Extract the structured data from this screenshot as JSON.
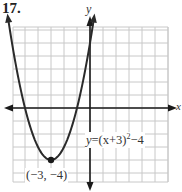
{
  "problem": {
    "number": "17."
  },
  "axes": {
    "x_label": "x",
    "y_label": "y"
  },
  "equation": {
    "lhs": "y",
    "rhs_prefix": "=(x+3)",
    "exponent": "2",
    "rhs_suffix": "−4",
    "full": "y=(x+3)^2−4"
  },
  "vertex": {
    "label": "(−3,  −4)",
    "x": -3,
    "y": -4
  },
  "colors": {
    "grid": "#c8c8c8",
    "axis": "#1a1a1a",
    "curve": "#2a2a2a"
  },
  "chart_data": {
    "type": "line",
    "title": "17.",
    "function": "y=(x+3)^2-4",
    "xlabel": "x",
    "ylabel": "y",
    "xlim": [
      -6,
      6
    ],
    "ylim": [
      -6,
      6
    ],
    "grid": true,
    "grid_step": 1,
    "legend": null,
    "series": [
      {
        "name": "y=(x+3)^2-4",
        "x": [
          -6.3,
          -6,
          -5,
          -4,
          -3,
          -2,
          -1,
          0,
          0.3
        ],
        "y": [
          6.9,
          5,
          0,
          -3,
          -4,
          -3,
          0,
          5,
          6.9
        ]
      }
    ],
    "annotations": [
      {
        "text": "(-3, -4)",
        "x": -3,
        "y": -4,
        "type": "vertex-point"
      },
      {
        "text": "y=(x+3)^2-4",
        "position": "right of y-axis, below x-axis"
      }
    ]
  }
}
